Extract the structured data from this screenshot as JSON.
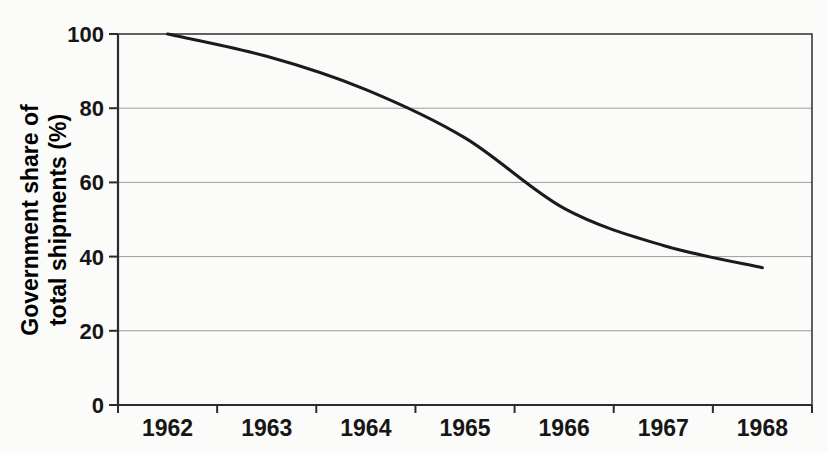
{
  "figure": {
    "background_color": "#fbfbf9",
    "text_color": "#161616"
  },
  "chart_data": {
    "type": "line",
    "categories": [
      "1962",
      "1963",
      "1964",
      "1965",
      "1966",
      "1967",
      "1968"
    ],
    "values": [
      100,
      94,
      85,
      72,
      53,
      43,
      37
    ],
    "title": "",
    "xlabel": "",
    "ylabel": "Government share of total shipments (%)",
    "ylabel_lines": [
      "Government share of",
      "total shipments (%)"
    ],
    "yticks": [
      0,
      20,
      40,
      60,
      80,
      100
    ],
    "ylim": [
      0,
      100
    ],
    "grid": true,
    "legend_position": "none",
    "line_color": "#1b1b1b",
    "grid_color": "#9c9c9c",
    "frame_color": "#3a3a3a",
    "axis_color": "#2c2c2c"
  }
}
